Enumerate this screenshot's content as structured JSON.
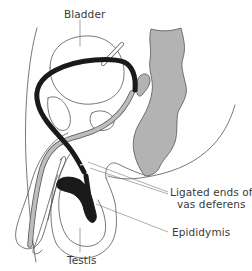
{
  "labels": {
    "bladder": "Bladder",
    "ligated_line1": "Ligated ends of",
    "ligated_line2": "vas deferens",
    "epididymis": "Epididymis",
    "testis": "Testis"
  },
  "colors": {
    "outline": "#555555",
    "vas_deferens": "#1a1a1a",
    "rectum_fill": "#b3b3b3",
    "urethra_fill": "#bdbdbd",
    "background": "#ffffff",
    "text": "#3a3a3a"
  }
}
